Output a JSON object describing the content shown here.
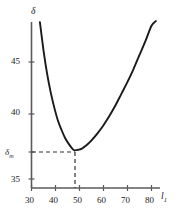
{
  "chart_data": {
    "type": "line",
    "title": "",
    "subtitle": "",
    "xlabel": "l1",
    "ylabel": "delta",
    "xlabel_display": "l",
    "xlabel_sub": "1",
    "ylabel_display": "δ",
    "xlim": [
      28,
      84
    ],
    "ylim": [
      34.3,
      48.6
    ],
    "grid": false,
    "legend": null,
    "xticks": [
      30,
      40,
      50,
      60,
      70,
      80
    ],
    "xtick_labels": [
      "30",
      "40",
      "50",
      "60",
      "70",
      "80"
    ],
    "yticks": [
      35,
      40,
      45
    ],
    "ytick_labels": [
      "35",
      "40",
      "45"
    ],
    "series": [
      {
        "name": "delta(l1)",
        "color": "#1a1a1a",
        "x": [
          33.5,
          35,
          36.5,
          38,
          39.5,
          41,
          42.5,
          44,
          45.5,
          47,
          48,
          49.5,
          51,
          53,
          55,
          57.5,
          60,
          62.5,
          65,
          67.5,
          70,
          72.5,
          75,
          77.5,
          80,
          81.8
        ],
        "y": [
          48.4,
          46.0,
          44.0,
          42.4,
          41.1,
          40.0,
          39.2,
          38.5,
          38.0,
          37.6,
          37.45,
          37.5,
          37.6,
          37.9,
          38.3,
          38.9,
          39.6,
          40.4,
          41.3,
          42.3,
          43.3,
          44.4,
          45.6,
          46.8,
          48.1,
          48.5
        ]
      }
    ],
    "annotations": {
      "minimum_point": {
        "x": 48,
        "y": 37.45
      },
      "min_y_label_display": "δ",
      "min_y_label_sub": "m",
      "guide_lines": "dashed",
      "guide_color": "#333333"
    }
  },
  "axis_labels": {
    "y_axis_title": "δ",
    "x_axis_title_base": "l",
    "x_axis_title_sub": "1",
    "y_tick_45": "45",
    "y_tick_40": "40",
    "y_tick_35": "35",
    "y_tick_min_base": "δ",
    "y_tick_min_sub": "m",
    "x_tick_30": "30",
    "x_tick_40": "40",
    "x_tick_50": "50",
    "x_tick_60": "60",
    "x_tick_70": "70",
    "x_tick_80": "80"
  },
  "style": {
    "curve_color": "#1a1a1a",
    "axis_color": "#5a5a5a",
    "dashed_color": "#333333",
    "background": "#ffffff"
  }
}
